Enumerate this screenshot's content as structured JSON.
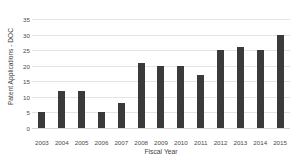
{
  "chart_data": {
    "type": "bar",
    "title": "",
    "xlabel": "Fiscal Year",
    "ylabel": "Patent Applications - DOC",
    "categories": [
      "2003",
      "2004",
      "2005",
      "2006",
      "2007",
      "2008",
      "2009",
      "2010",
      "2011",
      "2012",
      "2013",
      "2014",
      "2015"
    ],
    "values": [
      5,
      12,
      12,
      5,
      8,
      21,
      20,
      20,
      17,
      25,
      26,
      25,
      30
    ],
    "ylim": [
      0,
      35
    ],
    "yticks": [
      "0",
      "5",
      "10",
      "15",
      "20",
      "25",
      "30",
      "35"
    ],
    "ytick_values": [
      0,
      5,
      10,
      15,
      20,
      25,
      30,
      35
    ],
    "grid": true,
    "legend": false,
    "bar_color": "#3a3a3a",
    "gridline_color": "#e4e4e4",
    "background_color": "#ffffff"
  }
}
